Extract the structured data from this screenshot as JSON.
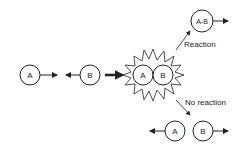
{
  "diagram": {
    "molecules": {
      "a_initial": "A",
      "b_initial": "B",
      "a_collision": "A",
      "b_collision": "B",
      "product": "A-B",
      "a_separated": "A",
      "b_separated": "B"
    },
    "labels": {
      "reaction": "Reaction",
      "no_reaction": "No reaction"
    },
    "colors": {
      "stroke": "#222222",
      "background": "#ffffff"
    }
  }
}
